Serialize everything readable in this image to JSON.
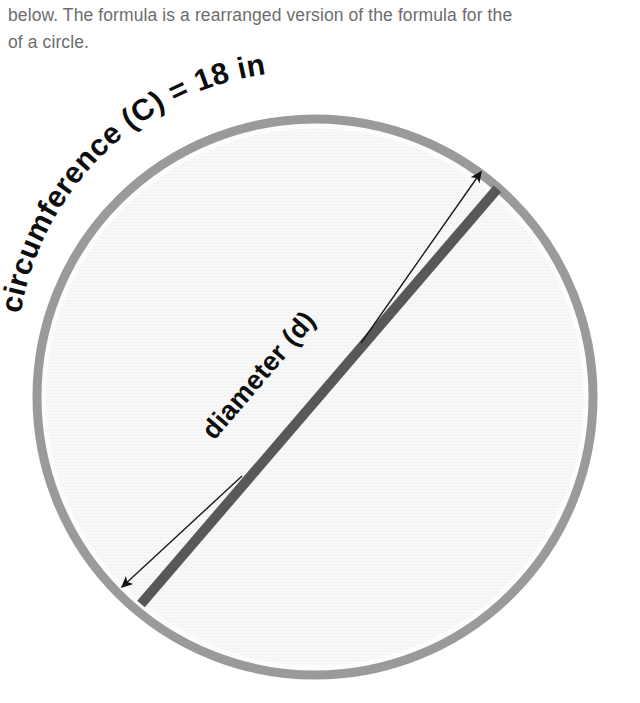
{
  "page": {
    "background_color": "#ffffff"
  },
  "body_text": {
    "line1": "below. The formula is a rearranged version of the formula for the",
    "line2": "of a circle.",
    "color": "#6d6d6d"
  },
  "figure": {
    "name": "circle-diameter-circumference-diagram",
    "circle": {
      "center_x": 315,
      "center_y": 397,
      "radius": 282,
      "ring_color": "#9a9a9a",
      "ring_width": 11,
      "fill_color": "#f7f7f7"
    },
    "diameter_line": {
      "color": "#585858",
      "width": 10,
      "x1": 141,
      "y1": 604,
      "x2": 504,
      "y2": 181
    },
    "measure_arrows": {
      "color": "#1a1a1a",
      "width": 1.4,
      "upper_tip_x": 481,
      "upper_tip_y": 171,
      "lower_tip_x": 119,
      "lower_tip_y": 590
    },
    "labels": {
      "circumference": "circumference (C) = 18 in",
      "diameter": "diameter (d)",
      "circumference_font_size": 30,
      "diameter_font_size": 27,
      "text_color": "#0d0d0d"
    }
  }
}
